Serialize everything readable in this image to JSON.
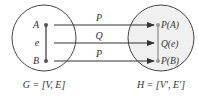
{
  "left_graph": {
    "caption": "G = [V, E]",
    "vertex_a": "A",
    "edge_e": "e",
    "vertex_b": "B"
  },
  "right_graph": {
    "caption": "H = [V', E']",
    "vertex_pa": "P(A)",
    "edge_qe": "Q(e)",
    "vertex_pb": "P(B)"
  },
  "mappings": [
    {
      "label": "P"
    },
    {
      "label": "Q"
    },
    {
      "label": "P"
    }
  ],
  "colors": {
    "stroke": "#444444",
    "right_fill": "#f0f0f0",
    "text": "#333333"
  }
}
